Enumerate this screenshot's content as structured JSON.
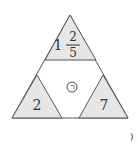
{
  "diagram": {
    "colors": {
      "shade": "#e6e6e6",
      "stroke": "#555555",
      "text": "#333333",
      "background": "#ffffff"
    },
    "top_triangle": {
      "whole": "1",
      "numerator": "2",
      "denominator": "5"
    },
    "left_triangle": {
      "value": "2"
    },
    "right_triangle": {
      "value": "7"
    },
    "center": {
      "label": "㉠"
    },
    "corner_mark": ")"
  }
}
